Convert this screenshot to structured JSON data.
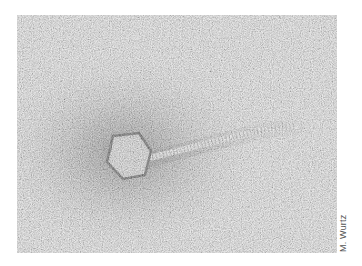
{
  "figure": {
    "type": "electron-micrograph",
    "credit": "M. Wurtz",
    "colors": {
      "background": "#ffffff",
      "field": "#dcdcdc",
      "halo": "#8a8a8a",
      "capsid_fill": "#cfcfcf",
      "capsid_edge": "#5a5a5a",
      "tail": "#e6e6e6"
    }
  }
}
